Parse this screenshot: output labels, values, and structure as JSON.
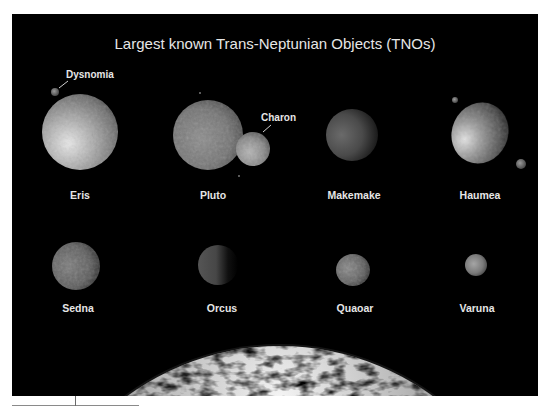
{
  "title": "Largest known Trans-Neptunian Objects (TNOs)",
  "objects": [
    {
      "name": "Eris",
      "moons": [
        "Dysnomia"
      ]
    },
    {
      "name": "Pluto",
      "moons": [
        "Charon"
      ]
    },
    {
      "name": "Makemake",
      "moons": []
    },
    {
      "name": "Haumea",
      "moons": []
    },
    {
      "name": "Sedna",
      "moons": []
    },
    {
      "name": "Orcus",
      "moons": []
    },
    {
      "name": "Quaoar",
      "moons": []
    },
    {
      "name": "Varuna",
      "moons": []
    }
  ],
  "background_body": "Earth",
  "colors": {
    "background": "#000000",
    "label": "#e6e6e6",
    "page": "#ffffff"
  }
}
